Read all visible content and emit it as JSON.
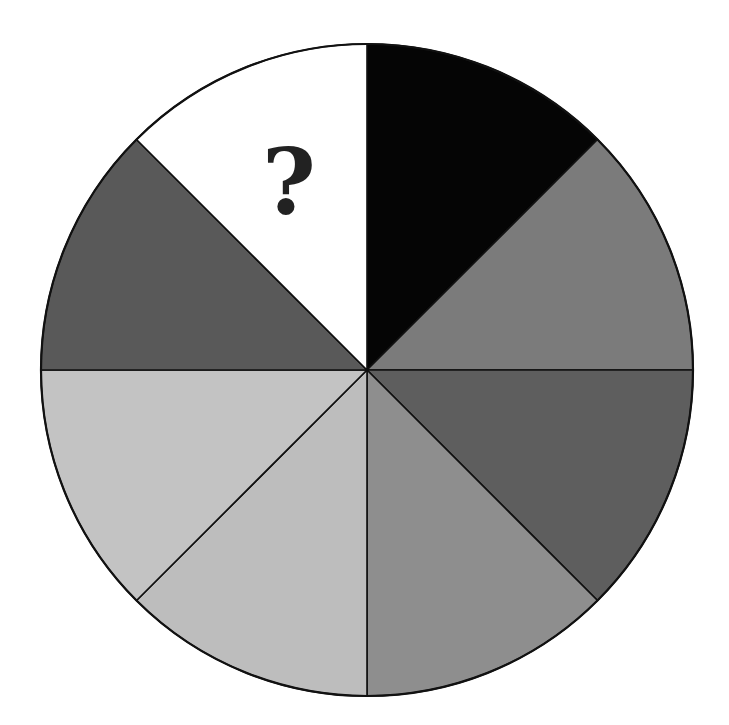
{
  "diagram": {
    "type": "segmented-circle-puzzle",
    "center": [
      367,
      370
    ],
    "radius": 326,
    "segment_count": 8,
    "segment_angle_deg": 45,
    "outline_color": "#111111",
    "segments": [
      {
        "index": 0,
        "position": "top-right-upper",
        "start_deg": 0,
        "end_deg": 45,
        "color": "#050505",
        "label": ""
      },
      {
        "index": 1,
        "position": "right-upper",
        "start_deg": 45,
        "end_deg": 90,
        "color": "#7b7b7b",
        "label": ""
      },
      {
        "index": 2,
        "position": "right-lower",
        "start_deg": 90,
        "end_deg": 135,
        "color": "#5e5e5e",
        "label": ""
      },
      {
        "index": 3,
        "position": "bottom-right",
        "start_deg": 135,
        "end_deg": 180,
        "color": "#8e8e8e",
        "label": ""
      },
      {
        "index": 4,
        "position": "bottom-left",
        "start_deg": 180,
        "end_deg": 225,
        "color": "#bdbdbd",
        "label": ""
      },
      {
        "index": 5,
        "position": "left-lower",
        "start_deg": 225,
        "end_deg": 270,
        "color": "#c3c3c3",
        "label": ""
      },
      {
        "index": 6,
        "position": "left-upper",
        "start_deg": 270,
        "end_deg": 315,
        "color": "#595959",
        "label": ""
      },
      {
        "index": 7,
        "position": "top-left-upper",
        "start_deg": 315,
        "end_deg": 360,
        "color": "#ffffff",
        "label": "?"
      }
    ],
    "missing_label": "?"
  }
}
